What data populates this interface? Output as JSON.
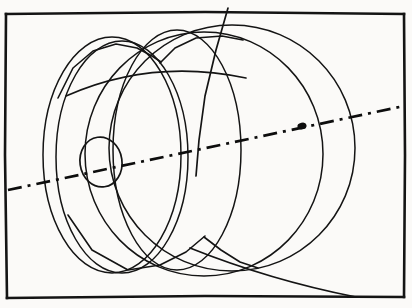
{
  "figure": {
    "kind": "line-drawing",
    "background_color": "#fbfaf8",
    "ink_color": "#141414",
    "width": 412,
    "height": 308
  },
  "frame": {
    "name": "drawing-border",
    "description": "Hand-drawn rectangular border enclosing the sketch",
    "stroke_color": "#141414",
    "stroke_width": 2.6,
    "left": 6,
    "top": 13,
    "right": 404,
    "bottom": 297
  },
  "axis": {
    "name": "centerline-axis",
    "description": "Dash-dot centre line running from lower-left to upper-right",
    "style": "dash-dot",
    "stroke_color": "#0d0d0d",
    "stroke_width": 2.7,
    "dash_pattern": "14 6 3 6",
    "start": {
      "x": 8,
      "y": 190
    },
    "end": {
      "x": 404,
      "y": 106
    },
    "point_marker": {
      "x": 302,
      "y": 126,
      "rx": 4.6,
      "ry": 3.4,
      "label": "axis-point"
    }
  },
  "shapes": [
    {
      "name": "bore-ellipse",
      "role": "central bore / hub opening",
      "cx": 101,
      "cy": 162,
      "rx": 21,
      "ry": 25,
      "rotation": -8
    },
    {
      "name": "front-disk-outer-ellipse",
      "role": "front face of disk",
      "cx": 112,
      "cy": 155,
      "rx": 69,
      "ry": 118,
      "rotation": -5
    },
    {
      "name": "front-disk-inner-ellipse",
      "role": "front face rim offset",
      "cx": 122,
      "cy": 157,
      "rx": 66,
      "ry": 116,
      "rotation": -6
    },
    {
      "name": "mid-disk-ellipse",
      "role": "intermediate disk section",
      "cx": 177,
      "cy": 150,
      "rx": 64,
      "ry": 120,
      "rotation": -4
    },
    {
      "name": "rear-large-circle",
      "role": "rear large circle of assembly",
      "cx": 232,
      "cy": 148,
      "rx": 123,
      "ry": 123,
      "rotation": 0
    },
    {
      "name": "rear-second-circle",
      "role": "second rear circle, offset left",
      "cx": 204,
      "cy": 154,
      "rx": 119,
      "ry": 122,
      "rotation": 0
    }
  ],
  "polylines": [
    {
      "name": "upper-faceted-outline",
      "role": "angular hand-drawn faceted top edge of front disk",
      "points": "58 98 73 68 93 51 116 44 137 48 152 56 161 62"
    },
    {
      "name": "upper-faceted-outline-secondary",
      "role": "angular top edge of second disk",
      "points": "160 63 175 48 196 38 222 36 243 40"
    },
    {
      "name": "steep-chord",
      "role": "steep straight chord crossing the top border",
      "points": "228 8 216 50 205 96 199 140 196 176"
    },
    {
      "name": "lower-faceted-outline",
      "role": "angular hand-drawn bottom edge of front disk",
      "points": "68 215 92 250 128 270 160 265 186 252 205 236"
    },
    {
      "name": "lower-faceted-outline-secondary",
      "role": "angular bottom edge of second disk",
      "points": "204 237 221 250 240 262 258 268"
    }
  ],
  "arcs": [
    {
      "name": "sweeping-lower-right-arc",
      "role": "long sweeping arc exiting toward the bottom-right border",
      "path": "M 190 248 C 240 268 300 286 356 297"
    },
    {
      "name": "cross-arc-upper",
      "role": "arc crossing the upper portion of the disks",
      "path": "M 66 96 C 120 72 180 64 246 78"
    }
  ]
}
